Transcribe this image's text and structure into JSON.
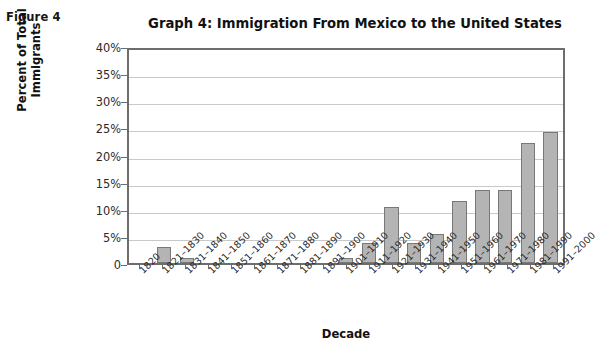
{
  "figure_label": "Figure 4",
  "chart_data": {
    "type": "bar",
    "title": "Graph 4: Immigration From Mexico to the United States",
    "xlabel": "Decade",
    "ylabel": "Percent of Total Immigrants",
    "ylim": [
      0,
      40
    ],
    "ytick_labels": [
      "0",
      "5%",
      "10%",
      "15%",
      "20%",
      "25%",
      "30%",
      "35%",
      "40%"
    ],
    "ytick_values": [
      0,
      5,
      10,
      15,
      20,
      25,
      30,
      35,
      40
    ],
    "grid": true,
    "legend": "none",
    "bar_color": "#b4b4b4",
    "bar_edge_color": "#787878",
    "categories": [
      "1820",
      "1821–1830",
      "1831–1840",
      "1841–1850",
      "1851–1860",
      "1861–1870",
      "1871–1880",
      "1881–1890",
      "1891–1900",
      "1901–1910",
      "1911–1920",
      "1921–1930",
      "1931–1940",
      "1941–1950",
      "1951–1960",
      "1961–1970",
      "1971–1980",
      "1981–1990",
      "1991–2000"
    ],
    "values": [
      0,
      3.0,
      1.0,
      0,
      0,
      0,
      0,
      0,
      0,
      1.0,
      3.7,
      10.6,
      3.7,
      5.5,
      11.6,
      13.7,
      13.7,
      22.5,
      24.6
    ]
  }
}
